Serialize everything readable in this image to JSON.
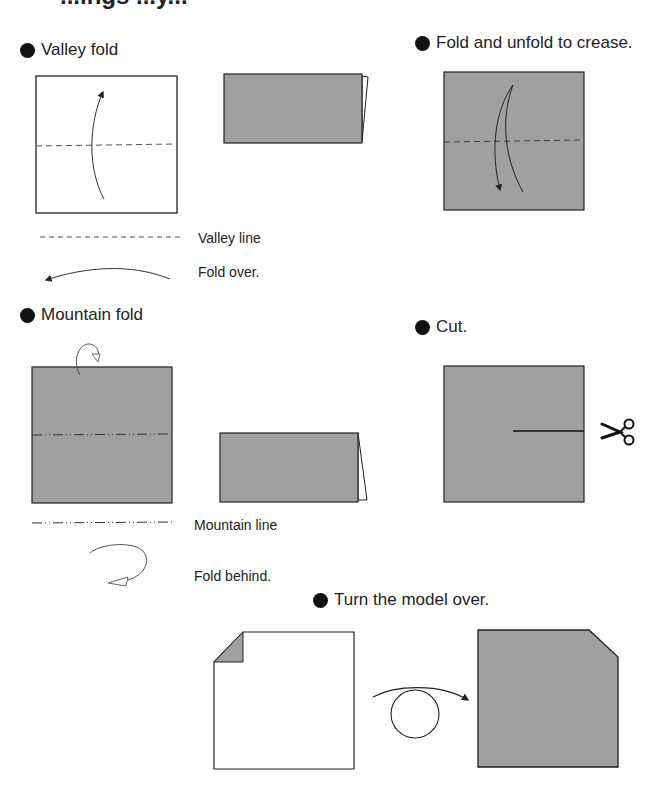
{
  "page": {
    "cropped_title": "...ings ...y...",
    "paper_color": "#a0a0a0",
    "line_color": "#222222"
  },
  "sections": {
    "valley_fold": {
      "heading": "Valley fold",
      "legend": [
        {
          "symbol": "valley-line",
          "label": "Valley line"
        },
        {
          "symbol": "fold-over-arrow",
          "label": "Fold over."
        }
      ]
    },
    "fold_unfold": {
      "heading": "Fold and unfold to crease."
    },
    "mountain_fold": {
      "heading": "Mountain fold",
      "legend": [
        {
          "symbol": "mountain-line",
          "label": "Mountain line"
        },
        {
          "symbol": "fold-behind-arrow",
          "label": "Fold behind."
        }
      ]
    },
    "cut": {
      "heading": "Cut."
    },
    "turn_over": {
      "heading": "Turn the model over."
    }
  }
}
